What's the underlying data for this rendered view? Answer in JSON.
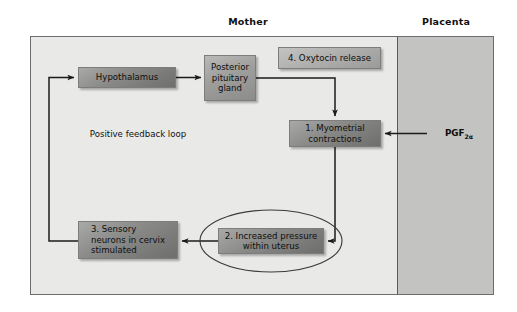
{
  "diagram": {
    "captions": {
      "mother": "Mother",
      "placenta": "Placenta"
    },
    "annotations": {
      "feedback_loop_line1": "Positive",
      "feedback_loop_line2": "feedback loop",
      "pgf_label": "PGF",
      "pgf_subscript": "2α"
    },
    "nodes": [
      {
        "id": "hypothalamus",
        "label": "Hypothalamus"
      },
      {
        "id": "pituitary",
        "line1": "Posterior",
        "line2": "pituitary",
        "line3": "gland"
      },
      {
        "id": "oxytocin",
        "label": "4. Oxytocin release"
      },
      {
        "id": "myometrial",
        "line1": "1. Myometrial",
        "line2": "contractions"
      },
      {
        "id": "pressure",
        "line1": "2. Increased pressure",
        "line2": "within uterus"
      },
      {
        "id": "sensory",
        "line1": "3. Sensory",
        "line2": "neurons in cervix",
        "line3": "stimulated"
      }
    ],
    "colors": {
      "frame_border": "#6d6d6d",
      "mother_fill": "#e9e9e7",
      "placenta_fill": "#c3c3c1",
      "box_fill_dark": "#8c8c8a",
      "box_fill_light": "#b9b9b7",
      "wire": "#1b1b1b",
      "text": "#0e0e0e"
    }
  }
}
